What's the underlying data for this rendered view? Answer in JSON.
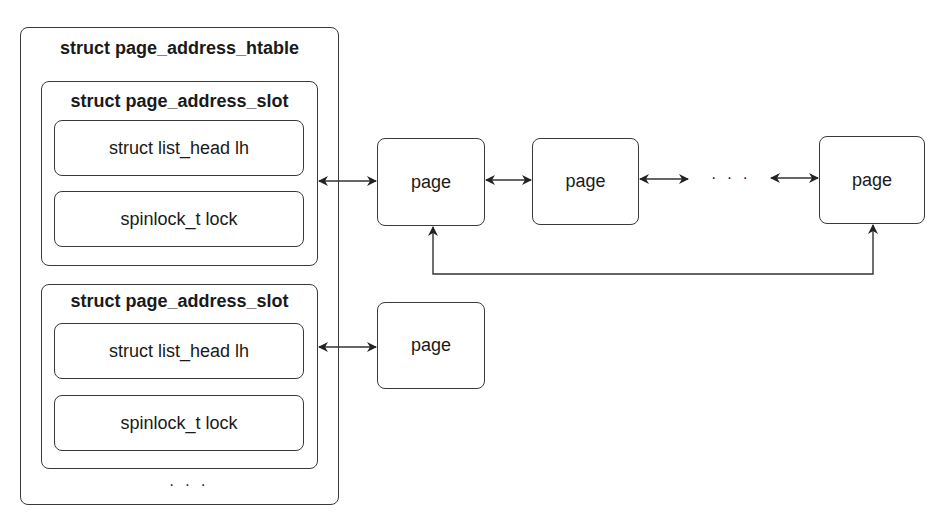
{
  "htable": {
    "title": "struct page_address_htable",
    "ellipsis": "· · ·"
  },
  "slots": [
    {
      "title": "struct page_address_slot",
      "fields": [
        "struct list_head lh",
        "spinlock_t lock"
      ]
    },
    {
      "title": "struct page_address_slot",
      "fields": [
        "struct list_head lh",
        "spinlock_t lock"
      ]
    }
  ],
  "chain1": {
    "pages": [
      "page",
      "page",
      "page"
    ],
    "ellipsis": "· · ·"
  },
  "chain2": {
    "pages": [
      "page"
    ]
  },
  "colors": {
    "stroke": "#3a3a3a",
    "text": "#1a1a1a",
    "background": "#ffffff"
  }
}
